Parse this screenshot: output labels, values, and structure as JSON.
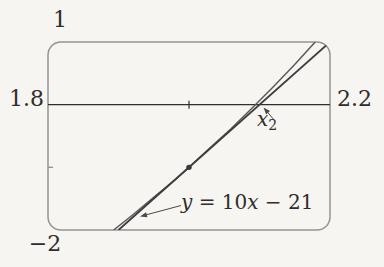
{
  "figure": {
    "background": "#f6f5f1",
    "frame_color": "#949494",
    "axis_color": "#2f2f2f",
    "curve_color": "#5a5a5a",
    "tangent_color": "#3d3d3d",
    "text_color": "#2e2d2b",
    "marker_color": "#3a3a3a",
    "arrow_color": "#4a4a4a"
  },
  "labels": {
    "window_top": "1",
    "window_bottom": "−2",
    "window_left": "1.8",
    "window_right": "2.2",
    "x2_base": "x",
    "x2_sub": "2",
    "eq_y": "y",
    "eq_mid": " = 10",
    "eq_x": "x",
    "eq_tail": " − 21"
  },
  "chart_data": {
    "type": "line",
    "title": "",
    "xlabel": "",
    "ylabel": "",
    "xlim": [
      1.8,
      2.2
    ],
    "ylim": [
      -2,
      1
    ],
    "grid": false,
    "legend": "none",
    "window_edge_labels": {
      "top": "1",
      "bottom": "−2",
      "left": "1.8",
      "right": "2.2"
    },
    "x_axis_y": 0,
    "x_ticks": [
      2.0
    ],
    "y_ticks": [
      -1
    ],
    "series": [
      {
        "name": "curve",
        "points": [
          [
            1.893,
            -2
          ],
          [
            1.92,
            -1.76
          ],
          [
            1.95,
            -1.48
          ],
          [
            1.98,
            -1.2
          ],
          [
            2.0,
            -1
          ],
          [
            2.03,
            -0.69
          ],
          [
            2.06,
            -0.38
          ],
          [
            2.09,
            -0.05
          ],
          [
            2.12,
            0.29
          ],
          [
            2.15,
            0.64
          ],
          [
            2.179,
            1
          ]
        ]
      },
      {
        "name": "tangent",
        "label": "y = 10x − 21",
        "points": [
          [
            1.9,
            -2
          ],
          [
            2.2,
            1
          ]
        ]
      }
    ],
    "marked_points": [
      [
        2.0,
        -1
      ]
    ],
    "annotations": [
      {
        "text": "x₂",
        "points_to": [
          2.1,
          0
        ]
      },
      {
        "text": "y = 10x − 21",
        "points_to_series": "tangent"
      }
    ]
  }
}
